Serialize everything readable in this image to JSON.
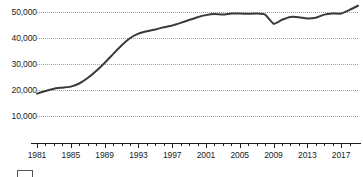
{
  "chart_data": {
    "type": "line",
    "title": "",
    "subtitle": "",
    "xlabel": "",
    "ylabel": "",
    "xlim": [
      1981,
      2019
    ],
    "ylim": [
      5000,
      55000
    ],
    "grid": "horizontal-dotted",
    "legend": "none",
    "line_color": "#3a3a3a",
    "y_ticks": [
      {
        "value": 50000,
        "label": "50,000"
      },
      {
        "value": 40000,
        "label": "40,000"
      },
      {
        "value": 30000,
        "label": "30,000"
      },
      {
        "value": 20000,
        "label": "20,000"
      },
      {
        "value": 10000,
        "label": "10,000"
      }
    ],
    "x_ticks": [
      {
        "value": 1981,
        "label": "1981"
      },
      {
        "value": 1985,
        "label": "1985"
      },
      {
        "value": 1989,
        "label": "1989"
      },
      {
        "value": 1993,
        "label": "1993"
      },
      {
        "value": 1997,
        "label": "1997"
      },
      {
        "value": 2001,
        "label": "2001"
      },
      {
        "value": 2005,
        "label": "2005"
      },
      {
        "value": 2009,
        "label": "2009"
      },
      {
        "value": 2013,
        "label": "2013"
      },
      {
        "value": 2017,
        "label": "2017"
      }
    ],
    "x_minor_tick_interval": 1,
    "series": [
      {
        "name": "",
        "x": [
          1981,
          1982,
          1983,
          1984,
          1985,
          1986,
          1987,
          1988,
          1989,
          1990,
          1991,
          1992,
          1993,
          1994,
          1995,
          1996,
          1997,
          1998,
          1999,
          2000,
          2001,
          2002,
          2003,
          2004,
          2005,
          2006,
          2007,
          2008,
          2009,
          2010,
          2011,
          2012,
          2013,
          2014,
          2015,
          2016,
          2017,
          2018,
          2019
        ],
        "values": [
          18600,
          19600,
          20500,
          20900,
          21300,
          22500,
          24600,
          27300,
          30400,
          33800,
          37100,
          39900,
          41700,
          42600,
          43300,
          44100,
          44800,
          45800,
          46900,
          48000,
          48800,
          49200,
          49000,
          49400,
          49400,
          49300,
          49400,
          49000,
          45500,
          47000,
          48100,
          48000,
          47500,
          47800,
          49000,
          49400,
          49400,
          50800,
          52400
        ]
      }
    ],
    "annotations": []
  },
  "caption": {
    "figure_label": "",
    "text_left": "",
    "text_right": ""
  }
}
